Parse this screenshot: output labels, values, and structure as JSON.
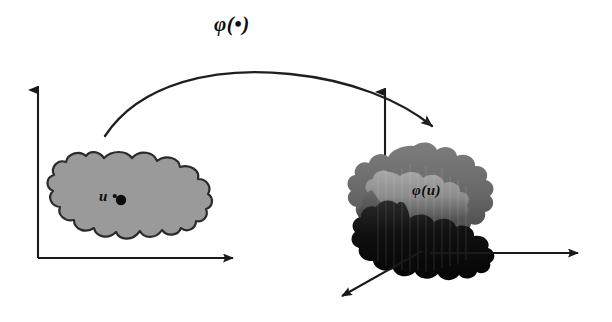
{
  "figure": {
    "background_color": "#ffffff",
    "width": 612,
    "height": 322,
    "stroke_color": "#1a1a1a"
  },
  "labels": {
    "map_operator": "φ(•)",
    "domain_point": "u •",
    "image_point": "φ(u)"
  },
  "domain_space": {
    "name": "input-space",
    "axes": {
      "vertical": {
        "from": [
          38,
          258
        ],
        "to": [
          38,
          84
        ]
      },
      "horizontal": {
        "from": [
          38,
          258
        ],
        "to": [
          240,
          258
        ]
      }
    },
    "region": {
      "name": "input-blob",
      "fill_color": "#9a9a9a",
      "stroke_color": "#2b2b2b",
      "bounds": [
        48,
        155,
        195,
        250
      ]
    },
    "marked_point": [
      116,
      200
    ]
  },
  "feature_space": {
    "name": "feature-space",
    "axes": {
      "vertical": {
        "from": [
          385,
          230
        ],
        "to": [
          385,
          86
        ]
      },
      "horizontal": {
        "from": [
          430,
          253
        ],
        "to": [
          585,
          253
        ]
      },
      "depth": {
        "from": [
          420,
          252
        ],
        "to": [
          336,
          300
        ]
      }
    },
    "region": {
      "name": "feature-blob",
      "top_fill_color": "#6f6f6f",
      "mid_fill_color": "#8c8c8c",
      "bottom_fill_color": "#0d0d0d",
      "bounds": [
        355,
        145,
        505,
        265
      ]
    }
  },
  "mapping_arrow": {
    "name": "mapping-curve",
    "start": [
      105,
      136
    ],
    "apex": [
      272,
      70
    ],
    "end": [
      437,
      131
    ],
    "stroke_color": "#1f1f1f"
  }
}
